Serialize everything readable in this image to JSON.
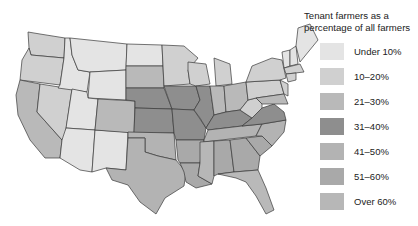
{
  "legend": {
    "title_line1": "Tenant farmers as a",
    "title_line2": "percentage of all farmers",
    "items": [
      {
        "label": "Under 10%",
        "color": "#e4e4e4"
      },
      {
        "label": "10–20%",
        "color": "#d0d0d0"
      },
      {
        "label": "21–30%",
        "color": "#b9b9b9"
      },
      {
        "label": "31–40%",
        "color": "#8e8e8e"
      },
      {
        "label": "41–50%",
        "color": "#b3b3b3"
      },
      {
        "label": "51–60%",
        "color": "#a9a9a9"
      },
      {
        "label": "Over 60%",
        "color": "#b7b7b7"
      }
    ]
  },
  "map": {
    "subject": "United States by state",
    "categories_by_state": {
      "WA": "10–20%",
      "OR": "10–20%",
      "CA": "21–30%",
      "NV": "10–20%",
      "ID": "Under 10%",
      "MT": "Under 10%",
      "WY": "Under 10%",
      "UT": "Under 10%",
      "AZ": "Under 10%",
      "NM": "Under 10%",
      "CO": "21–30%",
      "ND": "Under 10%",
      "SD": "21–30%",
      "NE": "31–40%",
      "KS": "31–40%",
      "OK": "41–50%",
      "TX": "41–50%",
      "MN": "10–20%",
      "IA": "31–40%",
      "MO": "31–40%",
      "AR": "51–60%",
      "LA": "51–60%",
      "WI": "10–20%",
      "IL": "31–40%",
      "MI": "10–20%",
      "IN": "21–30%",
      "OH": "21–30%",
      "KY": "31–40%",
      "TN": "41–50%",
      "MS": "Over 60%",
      "AL": "51–60%",
      "GA": "51–60%",
      "FL": "21–30%",
      "SC": "51–60%",
      "NC": "41–50%",
      "VA": "31–40%",
      "WV": "10–20%",
      "PA": "10–20%",
      "NY": "10–20%",
      "ME": "Under 10%",
      "NH": "Under 10%",
      "VT": "Under 10%",
      "MA": "10–20%",
      "NJ": "10–20%",
      "MD": "21–30%",
      "DE": "21–30%",
      "CT": "10–20%",
      "RI": "10–20%"
    }
  }
}
